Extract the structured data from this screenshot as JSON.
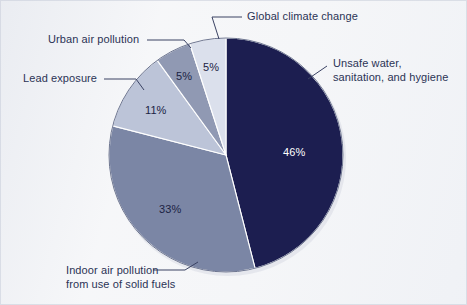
{
  "figure": {
    "background_color": "#f5f6f8",
    "text_color": "#2b3355"
  },
  "chart_data": {
    "type": "pie",
    "title": "",
    "subtitle": "",
    "xlabel": "",
    "ylabel": "",
    "legend_position": "none",
    "labels_position": "outside-with-leader-lines",
    "start_angle_deg": 0,
    "direction": "clockwise",
    "categories": [
      "Unsafe water, sanitation, and hygiene",
      "Indoor air pollution from use of solid fuels",
      "Lead exposure",
      "Urban air pollution",
      "Global climate change"
    ],
    "values": [
      46,
      33,
      11,
      5,
      5
    ],
    "value_labels": [
      "46%",
      "33%",
      "11%",
      "5%",
      "5%"
    ],
    "colors": [
      "#1c1e50",
      "#7b86a5",
      "#bcc4d8",
      "#9099b3",
      "#dbe0ec"
    ],
    "slices": [
      {
        "name": "unsafe-water",
        "label_line_1": "Unsafe water,",
        "label_line_2": "sanitation, and hygiene",
        "value": 46,
        "value_label": "46%",
        "color": "#1c1e50",
        "start_deg": 0,
        "end_deg": 165.6
      },
      {
        "name": "indoor-air-pollution",
        "label_line_1": "Indoor air pollution",
        "label_line_2": "from use of solid fuels",
        "value": 33,
        "value_label": "33%",
        "color": "#7b86a5",
        "start_deg": 165.6,
        "end_deg": 284.4
      },
      {
        "name": "lead-exposure",
        "label_line_1": "Lead exposure",
        "label_line_2": "",
        "value": 11,
        "value_label": "11%",
        "color": "#bcc4d8",
        "start_deg": 284.4,
        "end_deg": 324.0
      },
      {
        "name": "urban-air-pollution",
        "label_line_1": "Urban air pollution",
        "label_line_2": "",
        "value": 5,
        "value_label": "5%",
        "color": "#9099b3",
        "start_deg": 324.0,
        "end_deg": 342.0
      },
      {
        "name": "global-climate-change",
        "label_line_1": "Global climate change",
        "label_line_2": "",
        "value": 5,
        "value_label": "5%",
        "color": "#dbe0ec",
        "start_deg": 342.0,
        "end_deg": 360.0
      }
    ]
  },
  "labels": {
    "global_climate_change": "Global climate change",
    "urban_air_pollution": "Urban air pollution",
    "lead_exposure": "Lead exposure",
    "unsafe_water_line1": "Unsafe water,",
    "unsafe_water_line2": "sanitation, and hygiene",
    "indoor_air_line1": "Indoor air pollution",
    "indoor_air_line2": "from use of solid fuels"
  },
  "percents": {
    "unsafe_water": "46%",
    "indoor_air": "33%",
    "lead_exposure": "11%",
    "urban_air": "5%",
    "global_climate": "5%"
  }
}
